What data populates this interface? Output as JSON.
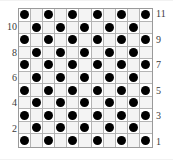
{
  "figure": {
    "background_color": "#ffffff",
    "plot_border_color": "#9a9a9a",
    "grid_line_color": "#b4b4b4",
    "dot_color": "#000000",
    "label_color": "#3a3a3a"
  },
  "chart_data": {
    "type": "heatmap",
    "title": "",
    "subtitle": "",
    "xlabel": "",
    "ylabel": "",
    "rows": 11,
    "columns": 11,
    "grid": true,
    "legend": "none",
    "marker": "filled-circle",
    "pattern": "checkerboard",
    "values": [
      [
        1,
        0,
        1,
        0,
        1,
        0,
        1,
        0,
        1,
        0,
        1
      ],
      [
        0,
        1,
        0,
        1,
        0,
        1,
        0,
        1,
        0,
        1,
        0
      ],
      [
        1,
        0,
        1,
        0,
        1,
        0,
        1,
        0,
        1,
        0,
        1
      ],
      [
        0,
        1,
        0,
        1,
        0,
        1,
        0,
        1,
        0,
        1,
        0
      ],
      [
        1,
        0,
        1,
        0,
        1,
        0,
        1,
        0,
        1,
        0,
        1
      ],
      [
        0,
        1,
        0,
        1,
        0,
        1,
        0,
        1,
        0,
        1,
        0
      ],
      [
        1,
        0,
        1,
        0,
        1,
        0,
        1,
        0,
        1,
        0,
        1
      ],
      [
        0,
        1,
        0,
        1,
        0,
        1,
        0,
        1,
        0,
        1,
        0
      ],
      [
        1,
        0,
        1,
        0,
        1,
        0,
        1,
        0,
        1,
        0,
        1
      ],
      [
        0,
        1,
        0,
        1,
        0,
        1,
        0,
        1,
        0,
        1,
        0
      ],
      [
        1,
        0,
        1,
        0,
        1,
        0,
        1,
        0,
        1,
        0,
        1
      ]
    ],
    "row_labels_right": [
      "11",
      "",
      "9",
      "",
      "7",
      "",
      "5",
      "",
      "3",
      "",
      "1"
    ],
    "row_labels_left": [
      "",
      "10",
      "",
      "8",
      "",
      "6",
      "",
      "4",
      "",
      "2",
      ""
    ],
    "dot_count": 61
  },
  "axes": {
    "left_labels": [
      {
        "text": "10",
        "row": 2
      },
      {
        "text": "8",
        "row": 4
      },
      {
        "text": "6",
        "row": 6
      },
      {
        "text": "4",
        "row": 8
      },
      {
        "text": "2",
        "row": 10
      }
    ],
    "right_labels": [
      {
        "text": "11",
        "row": 1
      },
      {
        "text": "9",
        "row": 3
      },
      {
        "text": "7",
        "row": 5
      },
      {
        "text": "5",
        "row": 7
      },
      {
        "text": "3",
        "row": 9
      },
      {
        "text": "1",
        "row": 11
      }
    ]
  }
}
